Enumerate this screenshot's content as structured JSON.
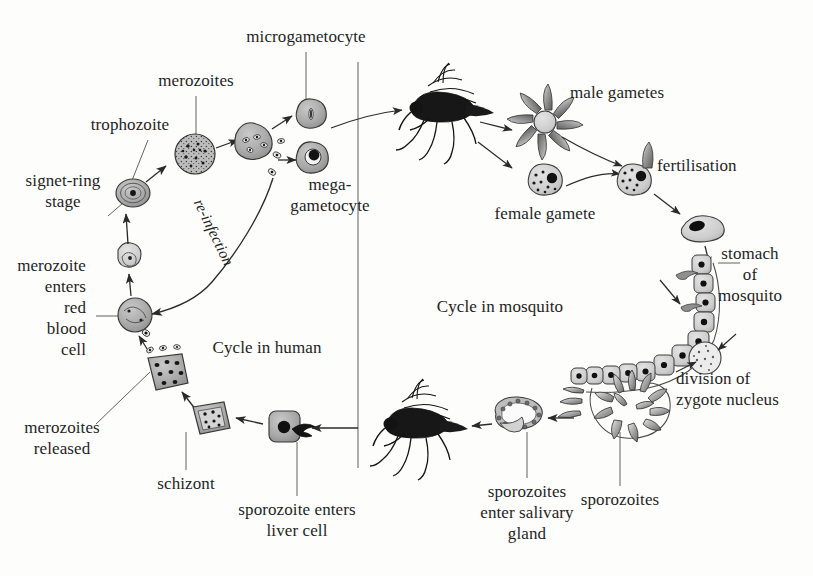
{
  "diagram": {
    "background_color": "#fdfdfc",
    "ink_color": "#1f1f1f",
    "cell_fill": "#a8a8a8",
    "cell_fill_light": "#cfcfcf",
    "nucleus_color": "#111111",
    "mosquito_color": "#141414"
  },
  "sections": {
    "human": "Cycle in human",
    "mosquito": "Cycle in mosquito"
  },
  "labels": {
    "microgametocyte": "microgametocyte",
    "merozoites_top": "merozoites",
    "trophozoite": "trophozoite",
    "signet_ring": "signet-ring\nstage",
    "merozoite_enters_rbc": "merozoite\nenters\nred\nblood\ncell",
    "merozoites_released": "merozoites\nreleased",
    "schizont": "schizont",
    "sporozoite_enters_liver": "sporozoite enters\nliver cell",
    "mega_gametocyte": "mega-\ngametocyte",
    "re_infection": "re-infection",
    "male_gametes": "male gametes",
    "female_gamete": "female gamete",
    "fertilisation": "fertilisation",
    "stomach_of_mosquito": "stomach\nof\nmosquito",
    "division_of_zygote_nucleus": "division of\nzygote nucleus",
    "sporozoites": "sporozoites",
    "sporozoites_enter_salivary_gland": "sporozoites\nenter salivary\ngland"
  },
  "stages": [
    {
      "id": "merozoite-free",
      "name": "free merozoite"
    },
    {
      "id": "signet-ring",
      "name": "signet-ring stage"
    },
    {
      "id": "trophozoite",
      "name": "trophozoite"
    },
    {
      "id": "merozoite-cluster",
      "name": "merozoites"
    },
    {
      "id": "microgametocyte",
      "name": "microgametocyte"
    },
    {
      "id": "megagametocyte",
      "name": "mega-gametocyte"
    },
    {
      "id": "mosquito-biting",
      "name": "mosquito taking blood meal"
    },
    {
      "id": "male-gametes",
      "name": "male gametes rosette"
    },
    {
      "id": "female-gamete",
      "name": "female gamete"
    },
    {
      "id": "fertilisation",
      "name": "fertilisation"
    },
    {
      "id": "zygote",
      "name": "zygote / ookinete"
    },
    {
      "id": "stomach-wall",
      "name": "stomach wall of mosquito"
    },
    {
      "id": "zygote-division",
      "name": "division of zygote nucleus"
    },
    {
      "id": "oocyst-sporozoites",
      "name": "oocyst releasing sporozoites"
    },
    {
      "id": "salivary-gland",
      "name": "salivary gland"
    },
    {
      "id": "mosquito-injecting",
      "name": "mosquito injecting sporozoites"
    },
    {
      "id": "liver-cell",
      "name": "sporozoite enters liver cell"
    },
    {
      "id": "schizont",
      "name": "schizont"
    },
    {
      "id": "merozoites-released",
      "name": "merozoites released"
    },
    {
      "id": "red-blood-cell",
      "name": "red blood cell"
    }
  ]
}
